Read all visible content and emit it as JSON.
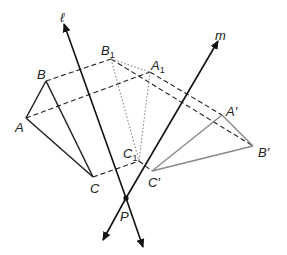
{
  "diagram": {
    "type": "geometry-reflection-composition",
    "lines": [
      {
        "label": "ℓ",
        "from": [
          142,
          248
        ],
        "to": [
          64,
          28
        ]
      },
      {
        "label": "m",
        "from": [
          103,
          240
        ],
        "to": [
          216,
          45
        ]
      }
    ],
    "intersection": {
      "label": "P",
      "x": 126,
      "y": 198
    },
    "triangles": {
      "original": {
        "A": [
          26,
          118
        ],
        "B": [
          46,
          81
        ],
        "C": [
          93,
          177
        ],
        "color": "#222222"
      },
      "first_image": {
        "A1": [
          150,
          72
        ],
        "B1": [
          111,
          59
        ],
        "C1": [
          139,
          161
        ],
        "style": "dotted",
        "color": "#888888"
      },
      "final_image": {
        "A'": [
          222,
          115
        ],
        "B'": [
          253,
          146
        ],
        "C'": [
          152,
          171
        ],
        "color": "#888888"
      }
    },
    "labels": {
      "l": "ℓ",
      "m": "m",
      "P": "P",
      "A": "A",
      "B": "B",
      "C": "C",
      "B1_main": "B",
      "B1_sub": "1",
      "A1_main": "A",
      "A1_sub": "1",
      "C1_main": "C",
      "C1_sub": "1",
      "A_prime": "A′",
      "B_prime": "B′",
      "C_prime": "C′"
    }
  }
}
